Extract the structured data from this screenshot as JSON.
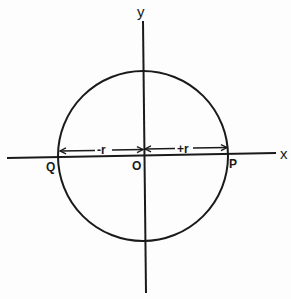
{
  "diagram": {
    "axes": {
      "x_label": "x",
      "y_label": "y"
    },
    "points": {
      "origin": "O",
      "right": "P",
      "left": "Q"
    },
    "radii": {
      "negative": "-r",
      "positive": "+r"
    },
    "circle": {
      "center": [
        143,
        156
      ],
      "radius": 85
    },
    "colors": {
      "ink": "#1a1a1a",
      "background": "#fdfdfd"
    }
  }
}
